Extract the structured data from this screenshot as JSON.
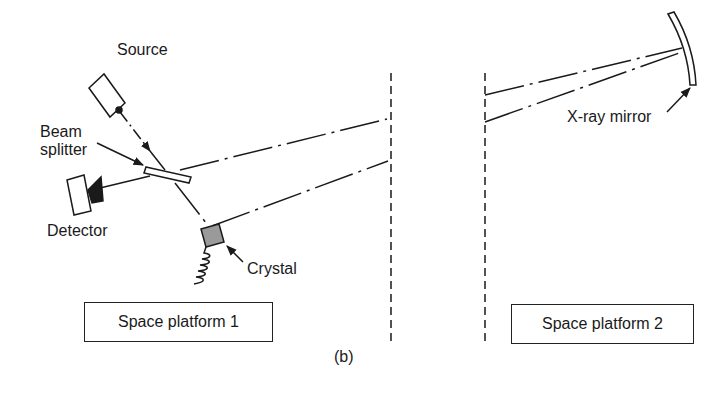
{
  "figure": {
    "caption": "(b)",
    "labels": {
      "source": "Source",
      "beam_splitter_line1": "Beam",
      "beam_splitter_line2": "splitter",
      "detector": "Detector",
      "crystal": "Crystal",
      "xray_mirror": "X-ray mirror"
    },
    "platforms": [
      {
        "label": "Space platform 1"
      },
      {
        "label": "Space platform 2"
      }
    ],
    "colors": {
      "line": "#1a1a1a",
      "crystal_fill": "#9a9a9a",
      "background": "#ffffff"
    }
  }
}
